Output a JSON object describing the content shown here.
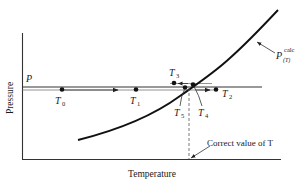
{
  "figure": {
    "axes": {
      "xlabel": "Temperature",
      "ylabel": "Pressure"
    },
    "pressure_level_label": "P",
    "curve_label": {
      "base": "P",
      "superscript": "calc",
      "subscript": "(T)"
    },
    "points": [
      {
        "id": "T0",
        "base": "T",
        "sub": "0"
      },
      {
        "id": "T1",
        "base": "T",
        "sub": "1"
      },
      {
        "id": "T2",
        "base": "T",
        "sub": "2"
      },
      {
        "id": "T3",
        "base": "T",
        "sub": "3"
      },
      {
        "id": "T4",
        "base": "T",
        "sub": "4"
      },
      {
        "id": "T5",
        "base": "T",
        "sub": "5"
      }
    ],
    "annotation": "Correct value of T",
    "colors": {
      "ink": "#1a1a1a",
      "background": "#ffffff"
    }
  }
}
